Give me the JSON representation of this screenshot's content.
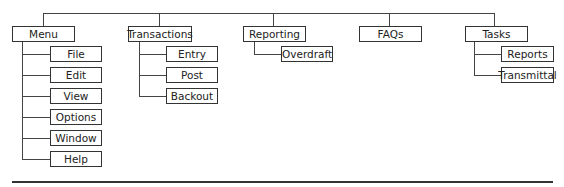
{
  "diagram": {
    "type": "menu-hierarchy",
    "top_menus": [
      {
        "label": "Menu",
        "children": [
          "File",
          "Edit",
          "View",
          "Options",
          "Window",
          "Help"
        ]
      },
      {
        "label": "Transactions",
        "children": [
          "Entry",
          "Post",
          "Backout"
        ]
      },
      {
        "label": "Reporting",
        "children": [
          "Overdraft"
        ]
      },
      {
        "label": "FAQs",
        "children": []
      },
      {
        "label": "Tasks",
        "children": [
          "Reports",
          "Transmittal"
        ]
      }
    ]
  }
}
